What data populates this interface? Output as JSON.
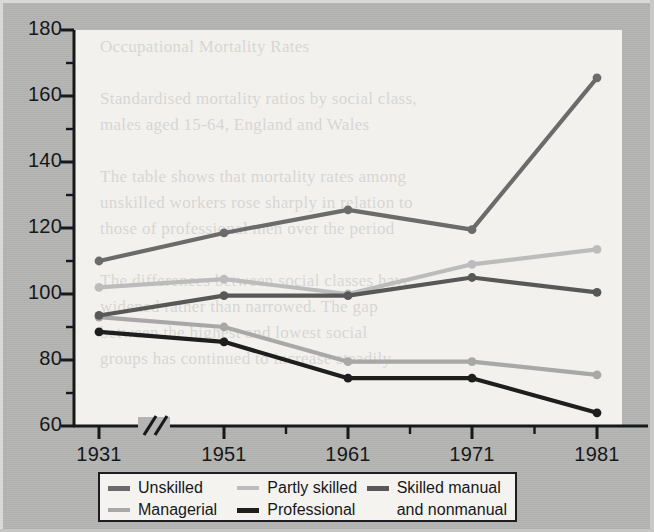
{
  "chart_data": {
    "type": "line",
    "title": "",
    "xlabel": "",
    "ylabel": "",
    "categories": [
      "1931",
      "1951",
      "1961",
      "1971",
      "1981"
    ],
    "x_tick_labels": [
      "1931",
      "1951",
      "1961",
      "1971",
      "1981"
    ],
    "y_tick_labels": [
      "180",
      "160",
      "140",
      "120",
      "100",
      "80",
      "60"
    ],
    "ylim": [
      60,
      180
    ],
    "y_major_step": 20,
    "y_minor_step": 10,
    "axis_break": "//",
    "axis_break_note": "broken x-axis between 1931 and 1951",
    "grid": false,
    "legend_position": "bottom",
    "markers": "circle",
    "series": [
      {
        "name": "Unskilled",
        "color": "#6b6b6b",
        "values": [
          110,
          118.5,
          125.5,
          119.5,
          165.5
        ]
      },
      {
        "name": "Managerial",
        "color": "#a8a8a8",
        "values": [
          93,
          90,
          79.5,
          79.5,
          75.5
        ]
      },
      {
        "name": "Partly skilled",
        "color": "#bcbcbc",
        "values": [
          102,
          104.5,
          100,
          109,
          113.5
        ]
      },
      {
        "name": "Professional",
        "color": "#1e1e1e",
        "values": [
          88.5,
          85.5,
          74.5,
          74.5,
          64
        ]
      },
      {
        "name": "Skilled manual and nonmanual",
        "color": "#585858",
        "values": [
          93.5,
          99.5,
          99.5,
          105,
          100.5
        ]
      }
    ]
  },
  "legend": {
    "columns": [
      {
        "entries": [
          {
            "label": "Unskilled",
            "color": "#6b6b6b",
            "weight": "thick"
          },
          {
            "label": "Managerial",
            "color": "#a8a8a8",
            "weight": "normal"
          }
        ]
      },
      {
        "entries": [
          {
            "label": "Partly skilled",
            "color": "#bcbcbc",
            "weight": "normal"
          },
          {
            "label": "Professional",
            "color": "#1e1e1e",
            "weight": "thick"
          }
        ]
      },
      {
        "entries": [
          {
            "label": "Skilled manual",
            "sublabel": "and nonmanual",
            "color": "#585858",
            "weight": "thick"
          }
        ]
      }
    ]
  },
  "ghost_text": "Occupational Mortality Rates\n\nStandardised mortality ratios by social class,\nmales aged 15-64, England and Wales\n\nThe table shows that mortality rates among\nunskilled workers rose sharply in relation to\nthose of professional men over the period\n\nThe differences between social classes have\nwidened rather than narrowed. The gap\nbetween the highest and lowest social\ngroups has continued to increase steadily.",
  "colors": {
    "page_background": "#b4b4b2",
    "plot_background": "#f2f1ee",
    "axis": "#16181b",
    "legend_border": "#1b1d20"
  }
}
